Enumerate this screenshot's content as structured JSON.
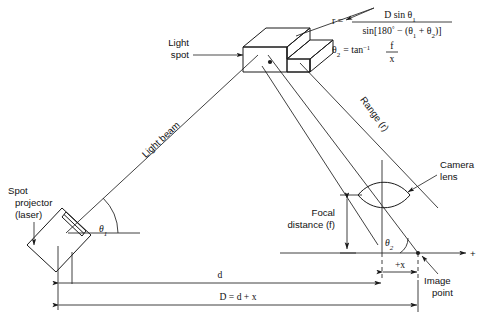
{
  "figure": {
    "labels": {
      "light_spot": [
        "Light",
        "spot"
      ],
      "spot_projector": [
        "Spot",
        "projector",
        "(laser)"
      ],
      "light_beam": "Light beam",
      "range": "Range (r)",
      "camera_lens": [
        "Camera",
        "lens"
      ],
      "focal_distance": [
        "Focal",
        "distance (f)"
      ],
      "image_point": [
        "Image",
        "point"
      ],
      "theta1": "θ",
      "theta1_sub": "1",
      "theta2": "θ",
      "theta2_sub": "2",
      "dim_d": "d",
      "dim_big_d": "D = d + x",
      "dim_plus_x": "+x",
      "axis_plus": "+"
    },
    "formulas": {
      "r_lhs": "r =",
      "r_numerator": "D sin θ",
      "r_numerator_sub": "1",
      "r_denom_a": "sin[180",
      "r_denom_deg": "°",
      "r_denom_b": " − (θ",
      "r_denom_sub1": "1",
      "r_denom_c": " + θ",
      "r_denom_sub2": "2",
      "r_denom_d": ")]",
      "theta2_lhs": "θ",
      "theta2_lhs_sub": "2",
      "theta2_eq": "= tan",
      "theta2_exp": "−1",
      "theta2_frac_num": "f",
      "theta2_frac_den": "x"
    },
    "colors": {
      "ink": "#1a1a1a",
      "background": "#ffffff",
      "thin_ink": "#2b2b2b"
    }
  }
}
